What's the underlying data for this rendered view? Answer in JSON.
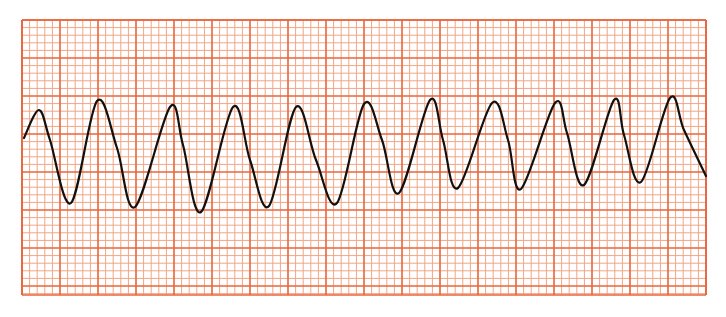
{
  "chart_data": {
    "type": "line",
    "title": "",
    "subtitle": "",
    "xlabel": "",
    "ylabel": "",
    "description": "ECG rhythm strip on standard red-orange grid paper showing a continuous sinusoidal wide-complex waveform (11 regular oscillations)",
    "grid": {
      "on": true,
      "origin_px": [
        22,
        20
      ],
      "extent_px": [
        706,
        295
      ],
      "major_spacing_px": 38,
      "minor_per_major": 5,
      "major_columns": 18,
      "major_rows": 7.2,
      "minor_color": "#f2a584",
      "major_color": "#e8643c",
      "background_color": "#ffffff"
    },
    "trace_color": "#111111",
    "trace_width": 2.2,
    "cycles": 11,
    "series": [
      {
        "name": "ECG trace",
        "points_px": [
          [
            24,
            138
          ],
          [
            39,
            110
          ],
          [
            50,
            140
          ],
          [
            71,
            203
          ],
          [
            97,
            101
          ],
          [
            117,
            148
          ],
          [
            135,
            207
          ],
          [
            170,
            107
          ],
          [
            183,
            145
          ],
          [
            201,
            212
          ],
          [
            233,
            107
          ],
          [
            250,
            160
          ],
          [
            269,
            206
          ],
          [
            296,
            107
          ],
          [
            316,
            160
          ],
          [
            337,
            203
          ],
          [
            364,
            104
          ],
          [
            382,
            140
          ],
          [
            399,
            193
          ],
          [
            430,
            100
          ],
          [
            443,
            140
          ],
          [
            458,
            188
          ],
          [
            492,
            103
          ],
          [
            508,
            140
          ],
          [
            521,
            189
          ],
          [
            555,
            103
          ],
          [
            567,
            133
          ],
          [
            584,
            185
          ],
          [
            614,
            100
          ],
          [
            624,
            135
          ],
          [
            641,
            182
          ],
          [
            670,
            98
          ],
          [
            684,
            130
          ],
          [
            706,
            176
          ]
        ]
      }
    ],
    "peaks_px": [
      [
        39,
        110
      ],
      [
        97,
        101
      ],
      [
        170,
        107
      ],
      [
        233,
        107
      ],
      [
        296,
        107
      ],
      [
        364,
        104
      ],
      [
        430,
        100
      ],
      [
        492,
        103
      ],
      [
        555,
        103
      ],
      [
        614,
        100
      ],
      [
        670,
        98
      ]
    ],
    "troughs_px": [
      [
        71,
        203
      ],
      [
        135,
        207
      ],
      [
        201,
        212
      ],
      [
        269,
        206
      ],
      [
        337,
        203
      ],
      [
        399,
        193
      ],
      [
        458,
        188
      ],
      [
        521,
        189
      ],
      [
        584,
        185
      ],
      [
        641,
        182
      ]
    ]
  }
}
